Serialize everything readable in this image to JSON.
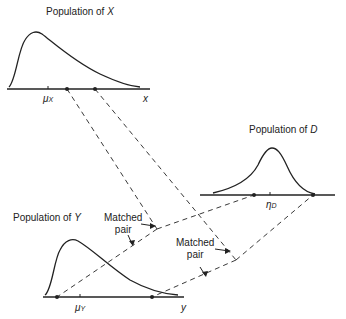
{
  "populations": {
    "x": {
      "title": "Population of",
      "var": "X",
      "axis_label": "x",
      "mean_label": "μ",
      "mean_sub": "X"
    },
    "d": {
      "title": "Population of",
      "var": "D",
      "axis_label": "",
      "mean_label": "η",
      "mean_sub": "D"
    },
    "y": {
      "title": "Population of",
      "var": "Y",
      "axis_label": "y",
      "mean_label": "μ",
      "mean_sub": "Y"
    }
  },
  "annotations": {
    "pair1_line1": "Matched",
    "pair1_line2": "pair",
    "pair2_line1": "Matched",
    "pair2_line2": "pair"
  },
  "colors": {
    "ink": "#222222",
    "background": "#ffffff"
  }
}
